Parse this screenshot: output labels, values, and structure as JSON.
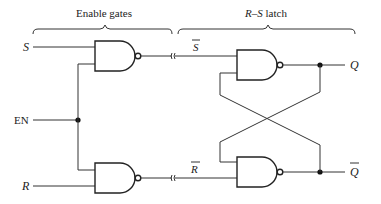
{
  "diagram": {
    "title_left": "Enable gates",
    "title_right": "R–S latch",
    "inputs": {
      "s": "S",
      "en": "EN",
      "r": "R"
    },
    "intermediate": {
      "s_bar": "S",
      "r_bar": "R"
    },
    "outputs": {
      "q": "Q",
      "q_bar": "Q"
    },
    "gates": [
      {
        "id": "enable-gate-s",
        "type": "NAND"
      },
      {
        "id": "enable-gate-r",
        "type": "NAND"
      },
      {
        "id": "latch-gate-top",
        "type": "NAND"
      },
      {
        "id": "latch-gate-bottom",
        "type": "NAND"
      }
    ],
    "colors": {
      "ink": "#222222",
      "background": "#ffffff"
    }
  }
}
